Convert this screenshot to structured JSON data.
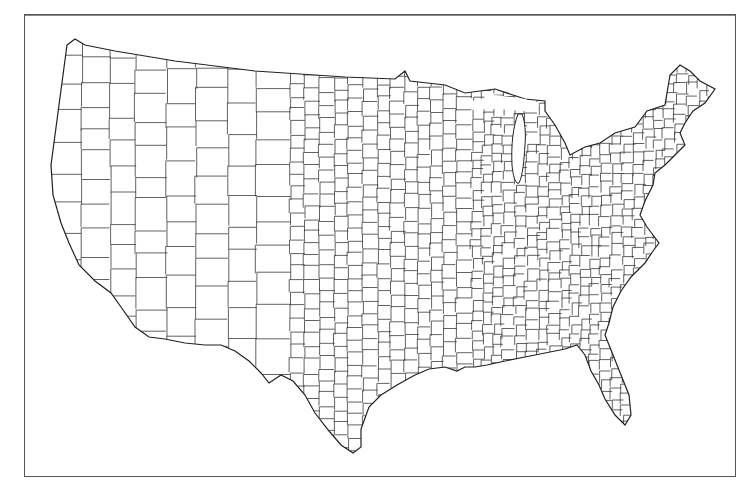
{
  "figure": {
    "caption_fragment": "",
    "frame_color": "#555555",
    "background": "#ffffff"
  },
  "map": {
    "type": "choropleth-outline",
    "subject": "Contiguous United States county boundaries",
    "projection": "Albers-like",
    "fill_color": "#ffffff",
    "stroke_color": "#333333",
    "has_legend": false,
    "has_labels": false,
    "regions_shown": [
      "West",
      "Great Plains",
      "Midwest",
      "South",
      "Northeast",
      "Texas",
      "Florida",
      "Great Lakes"
    ]
  }
}
